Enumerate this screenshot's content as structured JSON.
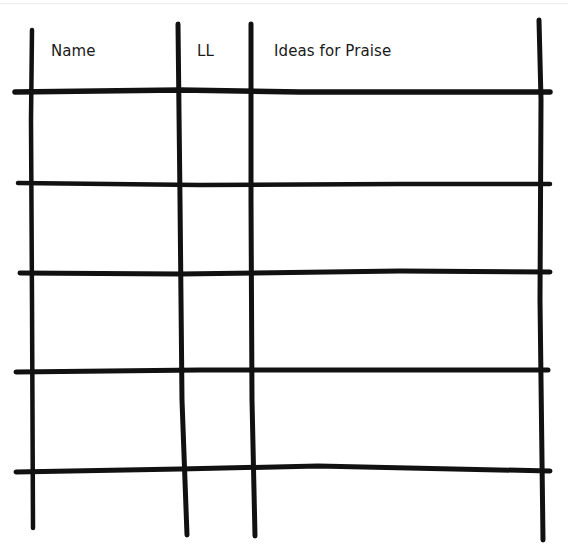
{
  "worksheet": {
    "columns": [
      {
        "label": "Name"
      },
      {
        "label": "LL"
      },
      {
        "label": "Ideas for Praise"
      }
    ],
    "rows": [
      {
        "name": "",
        "ll": "",
        "ideas": ""
      },
      {
        "name": "",
        "ll": "",
        "ideas": ""
      },
      {
        "name": "",
        "ll": "",
        "ideas": ""
      },
      {
        "name": "",
        "ll": "",
        "ideas": ""
      }
    ],
    "colors": {
      "ink": "#111111",
      "background": "#ffffff"
    }
  }
}
